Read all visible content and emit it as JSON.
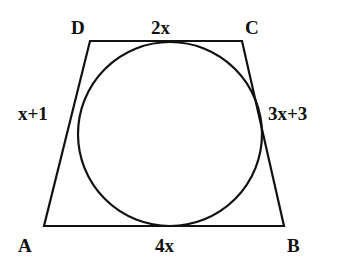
{
  "figure": {
    "type": "tangential quadrilateral with inscribed circle",
    "stroke_color": "#111111",
    "background": "#ffffff",
    "vertices": {
      "A": {
        "label": "A",
        "x": 44,
        "y": 226
      },
      "B": {
        "label": "B",
        "x": 284,
        "y": 226
      },
      "C": {
        "label": "C",
        "x": 242,
        "y": 41
      },
      "D": {
        "label": "D",
        "x": 90,
        "y": 41
      }
    },
    "circle": {
      "cx": 170,
      "cy": 134,
      "r": 92
    },
    "side_labels": {
      "DC": "2x",
      "AB": "4x",
      "AD": "x+1",
      "BC": "3x+3"
    }
  }
}
